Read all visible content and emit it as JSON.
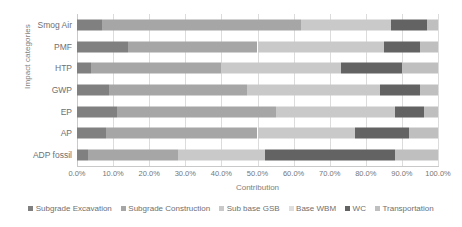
{
  "chart_data": {
    "type": "bar",
    "subtype": "stacked-horizontal-100pct",
    "title": "",
    "xlabel": "Contribution",
    "ylabel": "Impact categories",
    "xlim": [
      0,
      100
    ],
    "grid": true,
    "legend_position": "bottom",
    "categories": [
      "ADP fossil",
      "AP",
      "EP",
      "GWP",
      "HTP",
      "PMF",
      "Smog Air"
    ],
    "categories_top_to_bottom": [
      "Smog Air",
      "PMF",
      "HTP",
      "GWP",
      "EP",
      "AP",
      "ADP fossil"
    ],
    "x_tick_labels": [
      "0.0%",
      "10.0%",
      "20.0%",
      "30.0%",
      "40.0%",
      "50.0%",
      "60.0%",
      "70.0%",
      "80.0%",
      "90.0%",
      "100.0%"
    ],
    "x_tick_values": [
      0,
      10,
      20,
      30,
      40,
      50,
      60,
      70,
      80,
      90,
      100
    ],
    "series": [
      {
        "name": "Subgrade Excavation",
        "color": "#808080",
        "values": [
          3.0,
          8.0,
          11.0,
          9.0,
          4.0,
          14.0,
          7.0
        ]
      },
      {
        "name": "Subgrade Construction",
        "color": "#a6a6a6",
        "values": [
          25.0,
          42.0,
          44.0,
          38.0,
          36.0,
          36.0,
          55.0
        ]
      },
      {
        "name": "Sub base GSB",
        "color": "#c9c9c9",
        "values": [
          24.0,
          27.0,
          33.0,
          37.0,
          33.0,
          35.0,
          25.0
        ]
      },
      {
        "name": "Base WBM",
        "color": "#dedede",
        "values": [
          0.0,
          0.0,
          0.0,
          0.0,
          0.0,
          0.0,
          0.0
        ]
      },
      {
        "name": "WC",
        "color": "#636363",
        "values": [
          36.0,
          15.0,
          8.0,
          11.0,
          17.0,
          10.0,
          10.0
        ]
      },
      {
        "name": "Transportation",
        "color": "#bfbfbf",
        "values": [
          12.0,
          8.0,
          4.0,
          5.0,
          10.0,
          5.0,
          3.0
        ]
      }
    ]
  },
  "axes": {
    "y_title": "Impact categories",
    "x_title": "Contribution"
  }
}
